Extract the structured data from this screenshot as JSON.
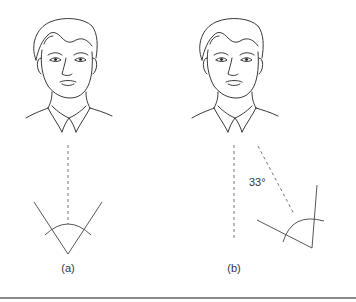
{
  "figure": {
    "panels": [
      {
        "id": "a",
        "label": "(a)",
        "description": "Head facing forward; dashed line of sight straight down to a symmetric angle with arc"
      },
      {
        "id": "b",
        "label": "(b)",
        "description": "Head with vertical reference dashed line and a second dashed line rotated; rotated angle with arc",
        "angle_label": "33°"
      }
    ],
    "colors": {
      "stroke": "#333333",
      "dash": "#666666",
      "rule": "#8a8a8a",
      "background": "#ffffff"
    }
  }
}
